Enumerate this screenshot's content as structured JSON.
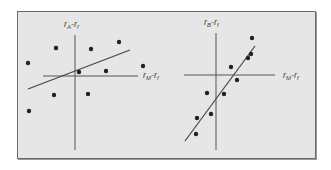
{
  "chart_data": [
    {
      "type": "scatter",
      "title": "",
      "ylabel": "r_A - r_f",
      "xlabel": "r_M - r_f",
      "axis_origin_px": [
        75,
        76
      ],
      "points_px": [
        [
          56,
          48
        ],
        [
          91,
          49
        ],
        [
          119,
          42
        ],
        [
          28,
          63
        ],
        [
          143,
          66
        ],
        [
          79,
          72
        ],
        [
          106,
          71
        ],
        [
          54,
          95
        ],
        [
          88,
          94
        ],
        [
          29,
          111
        ]
      ],
      "x": [
        -19,
        16,
        44,
        -47,
        68,
        4,
        31,
        -21,
        13,
        -46
      ],
      "y": [
        28,
        27,
        34,
        13,
        10,
        4,
        5,
        -19,
        -18,
        -35
      ],
      "regression_line": {
        "from": [
          28,
          89
        ],
        "to": [
          130,
          50
        ],
        "slope": 0.38
      },
      "grid": false,
      "note": "Low-beta asset A: weak fit, widely scattered points"
    },
    {
      "type": "scatter",
      "title": "",
      "ylabel": "r_B - r_f",
      "xlabel": "r_M - r_f",
      "axis_origin_px": [
        216,
        75
      ],
      "points_px": [
        [
          252,
          38
        ],
        [
          251,
          54
        ],
        [
          248,
          58
        ],
        [
          231,
          67
        ],
        [
          237,
          80
        ],
        [
          207,
          93
        ],
        [
          224,
          94
        ],
        [
          211,
          114
        ],
        [
          197,
          118
        ],
        [
          196,
          134
        ]
      ],
      "x": [
        36,
        35,
        32,
        15,
        21,
        -9,
        8,
        -5,
        -19,
        -20
      ],
      "y": [
        37,
        21,
        17,
        8,
        -5,
        -18,
        -19,
        -39,
        -43,
        -59
      ],
      "regression_line": {
        "from": [
          185,
          141
        ],
        "to": [
          255,
          46
        ],
        "slope": 1.36
      },
      "grid": false,
      "note": "High-beta asset B: tight fit, steep line"
    }
  ],
  "panels": {
    "a": {
      "y_label_main": "r",
      "y_label_sub": "A",
      "y_label_rest": "-r",
      "y_label_sub2": "f",
      "x_label_main": "r",
      "x_label_sub": "M",
      "x_label_rest": "-r",
      "x_label_sub2": "f"
    },
    "b": {
      "y_label_main": "r",
      "y_label_sub": "B",
      "y_label_rest": "-r",
      "y_label_sub2": "f",
      "x_label_main": "r",
      "x_label_sub": "M",
      "x_label_rest": "-r",
      "x_label_sub2": "f"
    }
  },
  "colors": {
    "background": "#e6e6e6",
    "frame": "#6a6a6a",
    "ink": "#222222",
    "axis": "#555555"
  }
}
